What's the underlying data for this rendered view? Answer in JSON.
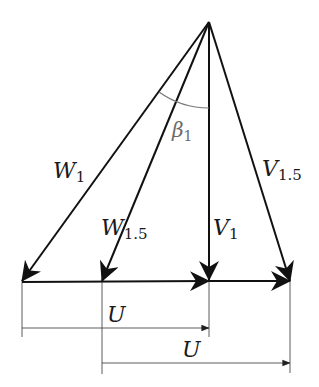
{
  "diagram": {
    "apex": {
      "x": 209,
      "y": 22
    },
    "baseline_y": 281,
    "vectors": [
      {
        "name": "W",
        "subscript": "1",
        "from": [
          209,
          22
        ],
        "to": [
          22,
          281
        ]
      },
      {
        "name": "W",
        "subscript": "1.5",
        "from": [
          209,
          22
        ],
        "to": [
          102,
          281
        ]
      },
      {
        "name": "V",
        "subscript": "1",
        "from": [
          209,
          22
        ],
        "to": [
          209,
          281
        ]
      },
      {
        "name": "V",
        "subscript": "1.5",
        "from": [
          209,
          22
        ],
        "to": [
          290,
          281
        ]
      },
      {
        "name": "U",
        "subscript": "",
        "from": [
          22,
          281
        ],
        "to": [
          209,
          281
        ]
      },
      {
        "name": "U",
        "subscript": "",
        "from": [
          102,
          281
        ],
        "to": [
          290,
          281
        ]
      }
    ],
    "angle": {
      "name": "β",
      "subscript": "1",
      "between": [
        "W1",
        "V1"
      ]
    },
    "labels": {
      "w1": {
        "main": "W",
        "sub": "1"
      },
      "w15": {
        "main": "W",
        "sub": "1.5"
      },
      "v1": {
        "main": "V",
        "sub": "1"
      },
      "v15": {
        "main": "V",
        "sub": "1.5"
      },
      "beta1": {
        "main": "β",
        "sub": "1"
      },
      "u_top": {
        "main": "U"
      },
      "u_bottom": {
        "main": "U"
      }
    },
    "dimensions": [
      {
        "label": "U",
        "from_x": 22,
        "to_x": 209,
        "y": 328
      },
      {
        "label": "U",
        "from_x": 102,
        "to_x": 290,
        "y": 363
      }
    ],
    "colors": {
      "stroke": "#111111",
      "angle_arc": "#777777",
      "dim_line": "#333333"
    }
  }
}
